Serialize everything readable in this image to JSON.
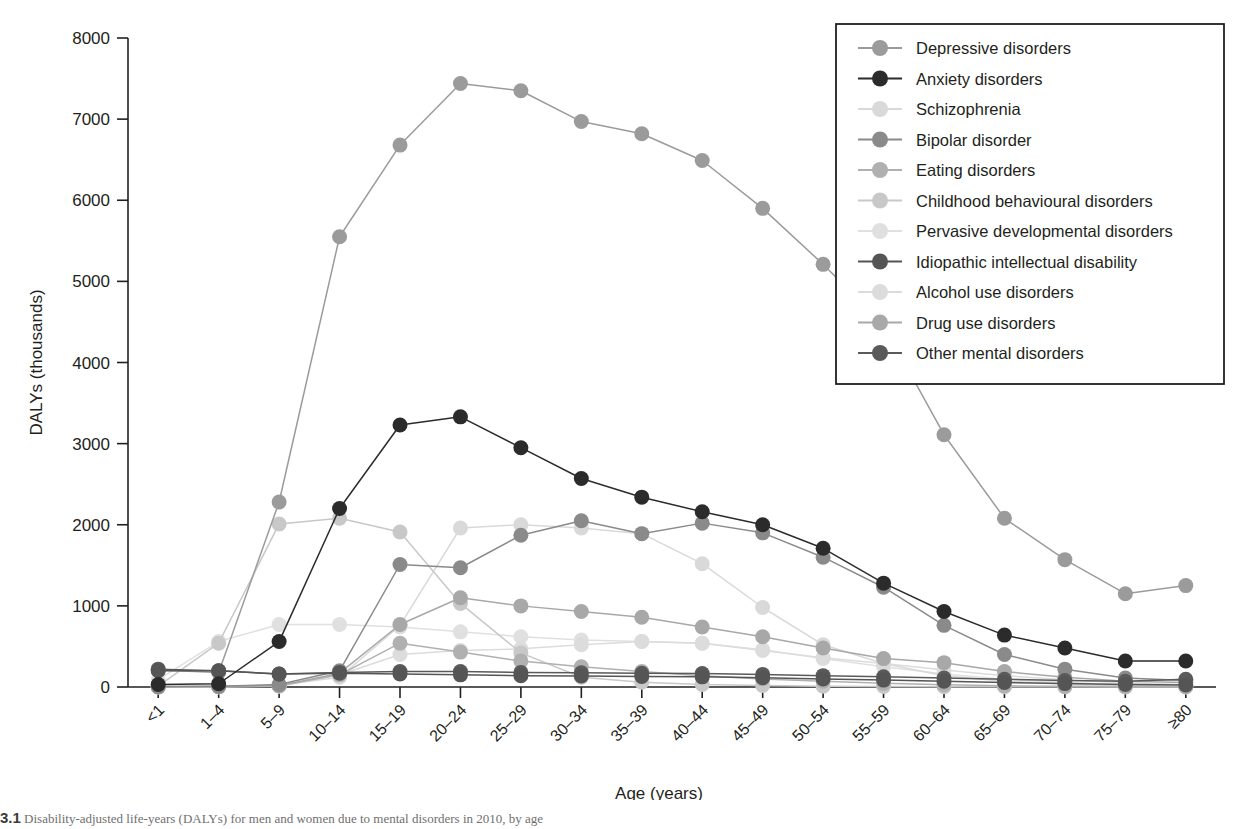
{
  "chart_data": {
    "type": "line",
    "title": "",
    "xlabel": "Age (years)",
    "ylabel": "DALYs (thousands)",
    "ylim": [
      0,
      8000
    ],
    "yticks": [
      0,
      1000,
      2000,
      3000,
      4000,
      5000,
      6000,
      7000,
      8000
    ],
    "grid": false,
    "legend_position": "top-right",
    "categories": [
      "<1",
      "1–4",
      "5–9",
      "10–14",
      "15–19",
      "20–24",
      "25–29",
      "30–34",
      "35–39",
      "40–44",
      "45–49",
      "50–54",
      "55–59",
      "60–64",
      "65–69",
      "70–74",
      "75–79",
      "≥80"
    ],
    "series": [
      {
        "name": "Depressive disorders",
        "color": "#9b9b9b",
        "values": [
          210,
          180,
          2280,
          5550,
          6680,
          7440,
          7350,
          6970,
          6820,
          6490,
          5900,
          5210,
          4460,
          3110,
          2080,
          1570,
          1150,
          1250
        ]
      },
      {
        "name": "Anxiety disorders",
        "color": "#2b2b2b",
        "values": [
          30,
          40,
          560,
          2200,
          3230,
          3330,
          2950,
          2570,
          2340,
          2160,
          2000,
          1710,
          1280,
          930,
          640,
          480,
          320,
          320
        ]
      },
      {
        "name": "Schizophrenia",
        "color": "#d9d9d9",
        "values": [
          5,
          10,
          20,
          120,
          760,
          1960,
          2000,
          1960,
          1890,
          1520,
          980,
          520,
          290,
          140,
          70,
          35,
          18,
          12
        ]
      },
      {
        "name": "Bipolar disorder",
        "color": "#8a8a8a",
        "values": [
          5,
          10,
          30,
          200,
          1510,
          1470,
          1870,
          2050,
          1890,
          2020,
          1900,
          1600,
          1230,
          760,
          400,
          220,
          110,
          80
        ]
      },
      {
        "name": "Eating disorders",
        "color": "#b0b0b0",
        "values": [
          0,
          5,
          15,
          150,
          540,
          430,
          320,
          250,
          190,
          140,
          100,
          70,
          45,
          28,
          15,
          9,
          5,
          4
        ]
      },
      {
        "name": "Childhood behavioural disorders",
        "color": "#c8c8c8",
        "values": [
          10,
          540,
          2010,
          2080,
          1910,
          1030,
          420,
          120,
          60,
          30,
          18,
          10,
          6,
          4,
          3,
          2,
          1,
          1
        ]
      },
      {
        "name": "Pervasive developmental disorders",
        "color": "#e0e0e0",
        "values": [
          90,
          560,
          770,
          770,
          740,
          680,
          620,
          580,
          560,
          540,
          460,
          350,
          250,
          160,
          95,
          55,
          28,
          15
        ]
      },
      {
        "name": "Idiopathic intellectual disability",
        "color": "#555555",
        "values": [
          200,
          200,
          160,
          170,
          160,
          150,
          140,
          135,
          130,
          125,
          115,
          100,
          85,
          70,
          55,
          42,
          30,
          25
        ]
      },
      {
        "name": "Alcohol use disorders",
        "color": "#dcdcdc",
        "values": [
          0,
          0,
          10,
          150,
          400,
          450,
          470,
          520,
          560,
          540,
          450,
          360,
          290,
          210,
          140,
          90,
          50,
          30
        ]
      },
      {
        "name": "Drug use disorders",
        "color": "#a8a8a8",
        "values": [
          0,
          5,
          15,
          170,
          770,
          1100,
          1000,
          930,
          860,
          740,
          620,
          480,
          350,
          300,
          190,
          120,
          70,
          55
        ]
      },
      {
        "name": "Other mental disorders",
        "color": "#5a5a5a",
        "values": [
          220,
          200,
          160,
          180,
          190,
          190,
          180,
          175,
          170,
          165,
          155,
          140,
          125,
          110,
          95,
          80,
          70,
          95
        ]
      }
    ]
  },
  "legend": {
    "items": [
      "Depressive disorders",
      "Anxiety disorders",
      "Schizophrenia",
      "Bipolar disorder",
      "Eating disorders",
      "Childhood behavioural disorders",
      "Pervasive developmental disorders",
      "Idiopathic intellectual disability",
      "Alcohol use disorders",
      "Drug use disorders",
      "Other mental disorders"
    ]
  },
  "caption": {
    "number": "3.1",
    "text": "Disability-adjusted life-years (DALYs) for men and women due to mental disorders in 2010, by age"
  }
}
